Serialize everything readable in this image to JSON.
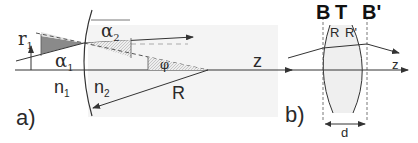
{
  "figure": {
    "panel_a": {
      "label": "a)",
      "r1": {
        "sym": "r",
        "sub": "1"
      },
      "alpha1": {
        "sym": "α",
        "sub": "1"
      },
      "alpha2": {
        "sym": "α",
        "sub": "2"
      },
      "phi": "φ",
      "z": "z",
      "n1": {
        "sym": "n",
        "sub": "1"
      },
      "n2": {
        "sym": "n",
        "sub": "2"
      },
      "R": "R"
    },
    "panel_b": {
      "label": "b)",
      "B": "B",
      "T": "T",
      "Bprime": "B'",
      "R_left": "R",
      "R_right": "R'",
      "z": "z",
      "d": "d"
    },
    "colors": {
      "line": "#333333",
      "shade_light": "#f2f2f2",
      "shade_dark": "#7a7a7a",
      "hatch": "#c8c8c8"
    }
  }
}
